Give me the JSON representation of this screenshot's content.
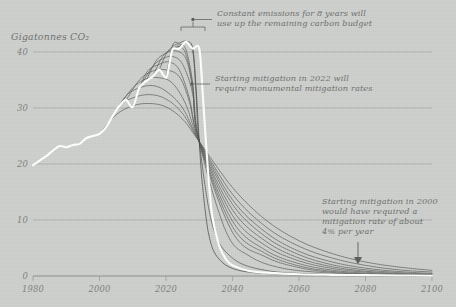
{
  "figure": {
    "background_color": "#ced0ce",
    "historical_line_color": "#ffffff",
    "scenario_line_color": "#4f514f",
    "grid_color": "#a9aba9",
    "text_color": "#6d6f6d"
  },
  "axes": {
    "y_axis_title": "Gigatonnes CO₂",
    "x_ticks": [
      "1980",
      "2000",
      "2020",
      "2040",
      "2060",
      "2080",
      "2100"
    ],
    "y_ticks": [
      "0",
      "10",
      "20",
      "30",
      "40"
    ],
    "xlim": [
      1980,
      2100
    ],
    "ylim": [
      0,
      45
    ],
    "grid": "horizontal"
  },
  "annotations": [
    {
      "id": "annotation-constant-emissions",
      "lines": [
        "Constant emissions for 8 years will",
        "use up the remaining carbon budget"
      ],
      "marker": "bracket-with-leader-dot",
      "points_to": "2022-2030 plateau at peak"
    },
    {
      "id": "annotation-mitigation-2022",
      "lines": [
        "Starting mitigation in 2022 will",
        "require monumental mitigation rates"
      ],
      "marker": "leader-line-dot",
      "points_to": "steepest descending curve"
    },
    {
      "id": "annotation-mitigation-2000",
      "lines": [
        "Starting mitigation in 2000",
        "would have required a",
        "mitigation rate of about",
        "4% per year"
      ],
      "marker": "down-arrow",
      "points_to": "shallow long tail near 2060"
    }
  ],
  "chart_data": {
    "type": "line",
    "title": "",
    "xlabel": "",
    "ylabel": "Gigatonnes CO₂",
    "xlim": [
      1980,
      2100
    ],
    "ylim": [
      0,
      45
    ],
    "grid": true,
    "legend": "none",
    "series": [
      {
        "name": "Historical and constant emissions (highlighted)",
        "color": "#ffffff",
        "emphasis": "thick-white",
        "x": [
          1980,
          1982,
          1984,
          1986,
          1988,
          1990,
          1992,
          1994,
          1996,
          1998,
          2000,
          2002,
          2004,
          2006,
          2008,
          2010,
          2012,
          2014,
          2016,
          2018,
          2020,
          2021,
          2022,
          2024,
          2026,
          2028,
          2030,
          2031,
          2032,
          2033,
          2034,
          2036,
          2038,
          2040,
          2045,
          2050,
          2060,
          2070,
          2080,
          2090,
          2100
        ],
        "y": [
          19.8,
          20.6,
          21.4,
          22.4,
          23.2,
          23.0,
          23.4,
          23.6,
          24.6,
          25.0,
          25.4,
          26.6,
          28.6,
          30.4,
          31.4,
          30.2,
          33.6,
          34.8,
          35.6,
          36.8,
          35.4,
          37.8,
          40.5,
          40.6,
          41.8,
          40.6,
          40.6,
          33.0,
          24.0,
          16.0,
          10.4,
          5.4,
          3.0,
          1.9,
          0.9,
          0.6,
          0.3,
          0.2,
          0.15,
          0.1,
          0.05
        ]
      },
      {
        "name": "Mitigation start 2000 (~4%/yr)",
        "color": "#5a5c5a",
        "x": [
          2000,
          2005,
          2010,
          2015,
          2020,
          2025,
          2030,
          2040,
          2050,
          2060,
          2070,
          2080,
          2090,
          2100
        ],
        "y": [
          25.4,
          28.8,
          30.4,
          30.8,
          30.2,
          28.0,
          24.0,
          15.8,
          10.0,
          6.3,
          4.0,
          2.5,
          1.6,
          1.0
        ]
      },
      {
        "name": "Mitigation start 2002",
        "color": "#5a5c5a",
        "x": [
          2002,
          2006,
          2010,
          2015,
          2020,
          2025,
          2030,
          2040,
          2050,
          2060,
          2070,
          2080,
          2090,
          2100
        ],
        "y": [
          26.6,
          30.4,
          31.8,
          32.4,
          31.6,
          29.0,
          24.0,
          14.6,
          8.8,
          5.3,
          3.2,
          1.9,
          1.1,
          0.7
        ]
      },
      {
        "name": "Mitigation start 2004",
        "color": "#5a5c5a",
        "x": [
          2004,
          2008,
          2012,
          2016,
          2020,
          2025,
          2030,
          2040,
          2050,
          2060,
          2070,
          2080,
          2090,
          2100
        ],
        "y": [
          28.6,
          32.2,
          33.6,
          34.0,
          33.0,
          30.0,
          24.0,
          13.6,
          7.8,
          4.4,
          2.5,
          1.4,
          0.8,
          0.45
        ]
      },
      {
        "name": "Mitigation start 2006",
        "color": "#5a5c5a",
        "x": [
          2006,
          2010,
          2014,
          2018,
          2022,
          2026,
          2030,
          2040,
          2050,
          2060,
          2070,
          2080,
          2090,
          2100
        ],
        "y": [
          30.4,
          33.6,
          35.2,
          35.4,
          34.4,
          30.6,
          24.0,
          12.8,
          7.0,
          3.8,
          2.0,
          1.1,
          0.6,
          0.32
        ]
      },
      {
        "name": "Mitigation start 2008",
        "color": "#5a5c5a",
        "x": [
          2008,
          2012,
          2016,
          2020,
          2024,
          2027,
          2030,
          2040,
          2050,
          2060,
          2070,
          2080,
          2090,
          2100
        ],
        "y": [
          31.4,
          35.0,
          36.6,
          36.8,
          35.6,
          31.2,
          24.0,
          11.8,
          6.2,
          3.2,
          1.65,
          0.85,
          0.45,
          0.23
        ]
      },
      {
        "name": "Mitigation start 2010",
        "color": "#5a5c5a",
        "x": [
          2010,
          2014,
          2018,
          2021,
          2024,
          2027,
          2030,
          2040,
          2050,
          2060,
          2070,
          2080,
          2090,
          2100
        ],
        "y": [
          30.2,
          36.2,
          37.8,
          38.2,
          36.8,
          31.8,
          24.0,
          10.8,
          5.4,
          2.7,
          1.35,
          0.68,
          0.34,
          0.17
        ]
      },
      {
        "name": "Mitigation start 2012",
        "color": "#5a5c5a",
        "x": [
          2012,
          2016,
          2019,
          2022,
          2025,
          2028,
          2030,
          2040,
          2050,
          2060,
          2070,
          2080,
          2090,
          2100
        ],
        "y": [
          33.6,
          37.4,
          38.8,
          39.2,
          37.8,
          32.6,
          24.0,
          9.8,
          4.6,
          2.2,
          1.05,
          0.5,
          0.24,
          0.12
        ]
      },
      {
        "name": "Mitigation start 2014",
        "color": "#5a5c5a",
        "x": [
          2014,
          2017,
          2020,
          2023,
          2026,
          2028,
          2030,
          2040,
          2050,
          2060,
          2070,
          2080,
          2090,
          2100
        ],
        "y": [
          34.8,
          38.4,
          39.8,
          40.2,
          38.8,
          33.4,
          24.0,
          8.8,
          4.0,
          1.8,
          0.82,
          0.37,
          0.17,
          0.08
        ]
      },
      {
        "name": "Mitigation start 2016",
        "color": "#5a5c5a",
        "x": [
          2016,
          2019,
          2022,
          2024,
          2026,
          2028,
          2030,
          2040,
          2050,
          2060,
          2070,
          2080,
          2090,
          2100
        ],
        "y": [
          35.6,
          39.2,
          40.6,
          41.0,
          39.6,
          34.0,
          24.0,
          7.8,
          3.4,
          1.5,
          0.64,
          0.27,
          0.12,
          0.05
        ]
      },
      {
        "name": "Mitigation start 2018",
        "color": "#5a5c5a",
        "x": [
          2018,
          2020,
          2022,
          2024,
          2026,
          2028,
          2030,
          2038,
          2045,
          2055,
          2070,
          2085,
          2100
        ],
        "y": [
          36.8,
          39.6,
          41.0,
          41.4,
          40.4,
          34.6,
          24.0,
          8.0,
          3.6,
          1.4,
          0.5,
          0.2,
          0.06
        ]
      },
      {
        "name": "Mitigation start 2020",
        "color": "#4f514f",
        "x": [
          2020,
          2022,
          2024,
          2026,
          2028,
          2029,
          2030,
          2034,
          2040,
          2050,
          2065,
          2085,
          2100
        ],
        "y": [
          35.4,
          41.2,
          41.6,
          41.9,
          40.2,
          33.0,
          24.0,
          9.0,
          3.2,
          1.0,
          0.35,
          0.1,
          0.03
        ]
      },
      {
        "name": "Mitigation start 2022 (monumental rate)",
        "color": "#3f413f",
        "x": [
          2022,
          2024,
          2026,
          2028,
          2029,
          2030,
          2031,
          2033,
          2036,
          2042,
          2055,
          2075,
          2100
        ],
        "y": [
          40.5,
          41.0,
          41.8,
          40.8,
          34.0,
          24.0,
          16.0,
          7.0,
          3.0,
          1.0,
          0.3,
          0.08,
          0.02
        ]
      }
    ]
  }
}
